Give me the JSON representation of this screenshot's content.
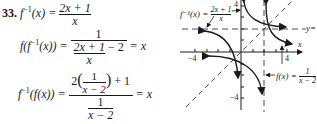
{
  "problem": {
    "number": "33.",
    "line1": {
      "lhs_f": "f",
      "lhs_sup": "−1",
      "lhs_arg": "(x) =",
      "num": "2x + 1",
      "den": "x"
    },
    "line2": {
      "lhs": "f(f",
      "lhs_sup": "−1",
      "lhs_rest": "(x)) =",
      "num": "1",
      "den_num": "2x + 1",
      "den_den": "x",
      "den_tail": "− 2",
      "rhs": "= x"
    },
    "line3": {
      "lhs_f": "f",
      "lhs_sup": "−1",
      "lhs_rest": "(f(x)) =",
      "num_pre": "2",
      "num_inner_num": "1",
      "num_inner_den": "x − 2",
      "num_post": "+ 1",
      "den_num": "1",
      "den_den": "x − 2",
      "rhs": "= x"
    }
  },
  "graph": {
    "label_finv": "f⁻¹(x) =",
    "label_finv_num": "2x + 1",
    "label_finv_den": "x",
    "label_f": "f(x) =",
    "label_f_num": "1",
    "label_f_den": "x − 2",
    "asymptote_label": "y=",
    "x_axis_label": "x",
    "tick_pos_x": "4",
    "tick_neg_x": "−4",
    "tick_pos_y": "4",
    "tick_neg_y": "−4"
  }
}
